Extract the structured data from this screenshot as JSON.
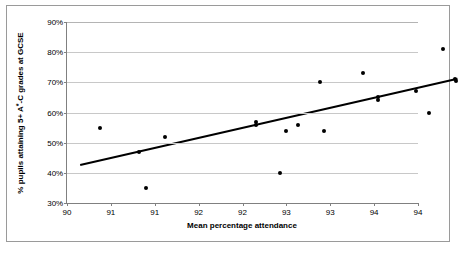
{
  "chart_data": {
    "type": "scatter",
    "title": "",
    "xlabel": "Mean percentage attendance",
    "ylabel": "% pupils attaining 5+ A*-C grades at GCSE",
    "xlim": [
      90,
      94
    ],
    "ylim": [
      30,
      90
    ],
    "grid": true,
    "legend": false,
    "x_tick_step": 0.5,
    "y_tick_step": 10,
    "x_tick_labels": [
      "90",
      "91",
      "91",
      "92",
      "92",
      "93",
      "93",
      "94",
      "94"
    ],
    "x_tick_values": [
      90,
      90.5,
      91,
      91.5,
      92,
      92.5,
      93,
      93.5,
      94
    ],
    "y_tick_labels": [
      "30%",
      "40%",
      "50%",
      "60%",
      "70%",
      "80%",
      "90%"
    ],
    "y_tick_values": [
      30,
      40,
      50,
      60,
      70,
      80,
      90
    ],
    "points": [
      {
        "x": 90.38,
        "y": 55.0
      },
      {
        "x": 90.82,
        "y": 47.0
      },
      {
        "x": 90.9,
        "y": 35.0
      },
      {
        "x": 91.12,
        "y": 52.0
      },
      {
        "x": 92.15,
        "y": 57.0
      },
      {
        "x": 92.15,
        "y": 56.0
      },
      {
        "x": 92.43,
        "y": 40.0
      },
      {
        "x": 92.5,
        "y": 54.0
      },
      {
        "x": 92.63,
        "y": 56.0
      },
      {
        "x": 92.88,
        "y": 70.0
      },
      {
        "x": 92.93,
        "y": 54.0
      },
      {
        "x": 93.37,
        "y": 73.0
      },
      {
        "x": 93.54,
        "y": 65.0
      },
      {
        "x": 93.54,
        "y": 64.0
      },
      {
        "x": 93.98,
        "y": 67.0
      },
      {
        "x": 94.12,
        "y": 59.7
      },
      {
        "x": 94.28,
        "y": 81.0
      },
      {
        "x": 94.42,
        "y": 71.0
      },
      {
        "x": 94.43,
        "y": 70.3
      }
    ],
    "trendline": {
      "type": "linear",
      "x_start": 90.15,
      "y_start": 42.6,
      "x_end": 94.45,
      "y_end": 71.2
    }
  }
}
